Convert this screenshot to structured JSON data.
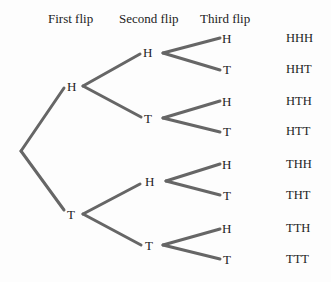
{
  "headers": {
    "first": "First flip",
    "second": "Second flip",
    "third": "Third flip"
  },
  "tree": {
    "level1": [
      "H",
      "T"
    ],
    "level2": [
      "H",
      "T",
      "H",
      "T"
    ],
    "level3": [
      "H",
      "T",
      "H",
      "T",
      "H",
      "T",
      "H",
      "T"
    ]
  },
  "outcomes": [
    "HHH",
    "HHT",
    "HTH",
    "HTT",
    "THH",
    "THT",
    "TTH",
    "TTT"
  ],
  "colors": {
    "branch": "#666666",
    "text": "#222222"
  }
}
